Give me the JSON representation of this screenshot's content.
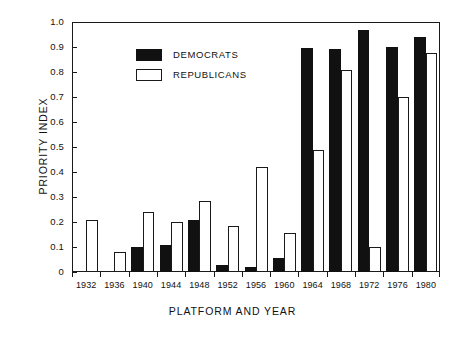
{
  "chart_data": {
    "type": "bar",
    "title": "",
    "xlabel": "PLATFORM AND YEAR",
    "ylabel": "PRIORITY INDEX",
    "categories": [
      "1932",
      "1936",
      "1940",
      "1944",
      "1948",
      "1952",
      "1956",
      "1960",
      "1964",
      "1968",
      "1972",
      "1976",
      "1980"
    ],
    "series": [
      {
        "name": "DEMOCRATS",
        "color": "#111111",
        "values": [
          0,
          0,
          0.1,
          0.11,
          0.21,
          0.03,
          0.02,
          0.055,
          0.895,
          0.893,
          0.97,
          0.9,
          0.94
        ]
      },
      {
        "name": "REPUBLICANS",
        "color": "#ffffff",
        "values": [
          0.21,
          0.08,
          0.24,
          0.2,
          0.285,
          0.185,
          0.42,
          0.155,
          0.49,
          0.81,
          0.1,
          0.7,
          0.875
        ]
      }
    ],
    "ylim": [
      0,
      1.0
    ],
    "y_ticks": [
      "0",
      "0.1",
      "0.2",
      "0.3",
      "0.4",
      "0.5",
      "0.6",
      "0.7",
      "0.8",
      "0.9",
      "1.0"
    ],
    "y_tick_values": [
      0,
      0.1,
      0.2,
      0.3,
      0.4,
      0.5,
      0.6,
      0.7,
      0.8,
      0.9,
      1.0
    ],
    "grid": false,
    "legend_position": "upper-left-inside",
    "legend": [
      {
        "label": "DEMOCRATS",
        "swatch": "filled-black"
      },
      {
        "label": "REPUBLICANS",
        "swatch": "outlined-white"
      }
    ]
  }
}
